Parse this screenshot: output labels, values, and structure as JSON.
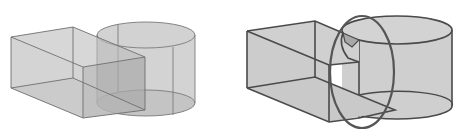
{
  "figure": {
    "panels": [
      {
        "id": "left",
        "description": "Translucent rectangular box overlapping a translucent cylinder",
        "fill": "#c8c8c8",
        "overlap_fill": "#a9a9a9",
        "stroke": "#6e6e6e"
      },
      {
        "id": "right",
        "description": "Opaque box joined with cylinder, intersection highlighted by a large oval",
        "fill": "#cfcfcf",
        "stroke": "#4a4a4a",
        "highlight_stroke": "#5a5a5a"
      }
    ]
  }
}
